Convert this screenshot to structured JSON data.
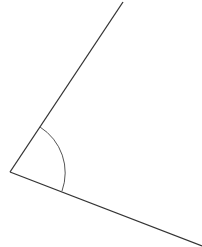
{
  "diagram": {
    "type": "angle",
    "background": "#ffffff",
    "stroke_color": "#333333",
    "arc_color": "#555555",
    "vertex": {
      "x": 10,
      "y": 172
    },
    "ray_upper_end": {
      "x": 123,
      "y": 2
    },
    "ray_lower_end": {
      "x": 202,
      "y": 246
    },
    "arc": {
      "start": {
        "x": 40,
        "y": 127
      },
      "end": {
        "x": 62,
        "y": 191
      },
      "radius": 54
    }
  }
}
